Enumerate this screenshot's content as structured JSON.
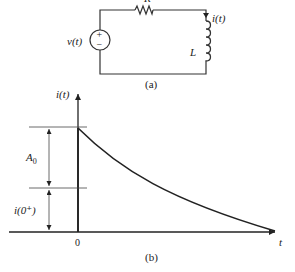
{
  "circuit": {
    "caption": "(a)",
    "resistor_label": "R",
    "source_label": "v(t)",
    "source_plus": "+",
    "source_minus": "−",
    "inductor_label": "L",
    "current_label": "i(t)"
  },
  "graph": {
    "caption": "(b)",
    "y_axis_label": "i(t)",
    "x_axis_label": "t",
    "origin_label": "0",
    "amplitude_label": "A",
    "amplitude_subscript": "0",
    "initial_label": "i(0⁺)"
  },
  "colors": {
    "stroke": "#222222",
    "background": "#ffffff"
  }
}
